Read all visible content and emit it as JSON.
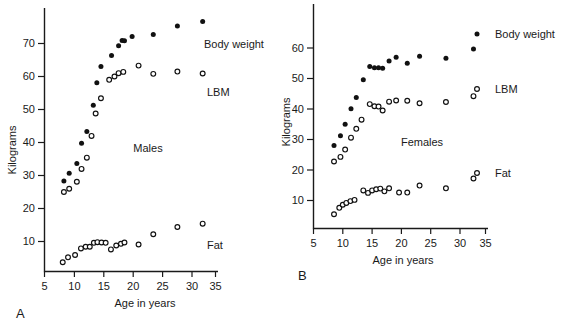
{
  "figure": {
    "panel_a_label": "A",
    "panel_b_label": "B"
  },
  "chart_data": [
    {
      "type": "scatter",
      "panel": "A",
      "title": "",
      "annotation": "Males",
      "xlabel": "Age in years",
      "ylabel": "Kilograms",
      "xlim": [
        5,
        36
      ],
      "ylim": [
        0,
        80
      ],
      "xticks": [
        5,
        10,
        15,
        20,
        25,
        30,
        35
      ],
      "yticks": [
        10,
        20,
        30,
        40,
        50,
        60,
        70
      ],
      "grid": false,
      "legend_position": "right-inline",
      "series": [
        {
          "name": "Body weight",
          "marker": "filled-circle",
          "color": "#111111",
          "points": [
            [
              8.3,
              28.3
            ],
            [
              9.2,
              30.7
            ],
            [
              10.5,
              33.6
            ],
            [
              11.3,
              39.8
            ],
            [
              12.2,
              43.3
            ],
            [
              13.3,
              51.3
            ],
            [
              13.9,
              58.1
            ],
            [
              14.6,
              63.0
            ],
            [
              16.4,
              66.4
            ],
            [
              17.6,
              69.3
            ],
            [
              18.2,
              70.9
            ],
            [
              18.6,
              70.8
            ],
            [
              19.9,
              72.1
            ],
            [
              23.5,
              72.7
            ],
            [
              27.6,
              75.3
            ],
            [
              31.9,
              76.7
            ]
          ]
        },
        {
          "name": "LBM",
          "marker": "open-circle",
          "color": "#111111",
          "points": [
            [
              8.3,
              25.0
            ],
            [
              9.2,
              26.0
            ],
            [
              10.5,
              28.1
            ],
            [
              11.3,
              32.0
            ],
            [
              12.2,
              35.4
            ],
            [
              13.0,
              42.0
            ],
            [
              13.7,
              48.8
            ],
            [
              14.6,
              53.4
            ],
            [
              16.0,
              59.0
            ],
            [
              16.9,
              60.0
            ],
            [
              17.6,
              61.0
            ],
            [
              18.4,
              61.4
            ],
            [
              21.0,
              63.3
            ],
            [
              23.5,
              60.8
            ],
            [
              27.6,
              61.5
            ],
            [
              31.9,
              60.9
            ]
          ]
        },
        {
          "name": "Fat",
          "marker": "open-circle",
          "color": "#111111",
          "points": [
            [
              8.1,
              3.7
            ],
            [
              9.0,
              5.2
            ],
            [
              10.2,
              5.9
            ],
            [
              11.2,
              7.9
            ],
            [
              12.0,
              8.4
            ],
            [
              12.7,
              8.4
            ],
            [
              13.4,
              9.6
            ],
            [
              14.0,
              9.8
            ],
            [
              14.7,
              9.7
            ],
            [
              15.4,
              9.6
            ],
            [
              16.3,
              7.6
            ],
            [
              17.2,
              8.8
            ],
            [
              18.0,
              9.3
            ],
            [
              18.6,
              9.7
            ],
            [
              21.0,
              9.1
            ],
            [
              23.5,
              12.2
            ],
            [
              27.6,
              14.4
            ],
            [
              31.9,
              15.4
            ]
          ]
        }
      ]
    },
    {
      "type": "scatter",
      "panel": "B",
      "title": "",
      "annotation": "Females",
      "xlabel": "Age in years",
      "ylabel": "Kilograms",
      "xlim": [
        5,
        36
      ],
      "ylim": [
        0,
        65
      ],
      "xticks": [
        5,
        10,
        15,
        20,
        25,
        30,
        35
      ],
      "yticks": [
        10,
        20,
        30,
        40,
        50,
        60
      ],
      "grid": false,
      "legend_position": "right-inline",
      "series": [
        {
          "name": "Body weight",
          "marker": "filled-circle",
          "color": "#111111",
          "points": [
            [
              8.5,
              28.0
            ],
            [
              9.6,
              31.2
            ],
            [
              10.4,
              35.0
            ],
            [
              11.4,
              40.1
            ],
            [
              12.3,
              43.8
            ],
            [
              13.5,
              49.6
            ],
            [
              14.6,
              53.9
            ],
            [
              15.4,
              53.5
            ],
            [
              16.1,
              53.5
            ],
            [
              16.8,
              53.4
            ],
            [
              17.9,
              55.7
            ],
            [
              19.1,
              57.0
            ],
            [
              21.0,
              55.0
            ],
            [
              23.1,
              57.3
            ],
            [
              27.6,
              56.6
            ],
            [
              32.3,
              59.7
            ]
          ]
        },
        {
          "name": "LBM",
          "marker": "open-circle",
          "color": "#111111",
          "points": [
            [
              8.5,
              22.8
            ],
            [
              9.6,
              24.3
            ],
            [
              10.4,
              26.7
            ],
            [
              11.4,
              30.6
            ],
            [
              12.3,
              33.5
            ],
            [
              13.2,
              36.5
            ],
            [
              14.6,
              41.6
            ],
            [
              15.4,
              40.9
            ],
            [
              16.1,
              40.8
            ],
            [
              16.8,
              39.5
            ],
            [
              17.9,
              42.4
            ],
            [
              19.1,
              42.8
            ],
            [
              21.0,
              42.7
            ],
            [
              23.1,
              41.9
            ],
            [
              27.6,
              42.3
            ],
            [
              32.3,
              44.2
            ]
          ]
        },
        {
          "name": "Fat",
          "marker": "open-circle",
          "color": "#111111",
          "points": [
            [
              8.5,
              5.5
            ],
            [
              9.4,
              7.6
            ],
            [
              10.0,
              8.6
            ],
            [
              10.6,
              9.2
            ],
            [
              11.3,
              9.8
            ],
            [
              12.0,
              10.2
            ],
            [
              13.5,
              13.3
            ],
            [
              14.3,
              12.5
            ],
            [
              15.0,
              13.3
            ],
            [
              15.7,
              13.7
            ],
            [
              16.4,
              13.9
            ],
            [
              17.1,
              13.0
            ],
            [
              17.9,
              14.0
            ],
            [
              19.6,
              12.6
            ],
            [
              21.0,
              12.6
            ],
            [
              23.1,
              14.9
            ],
            [
              27.6,
              14.0
            ],
            [
              32.3,
              17.2
            ]
          ]
        }
      ]
    }
  ]
}
